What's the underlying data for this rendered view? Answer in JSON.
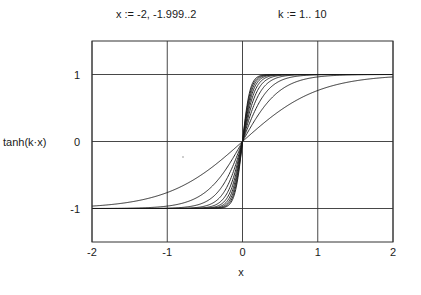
{
  "definitions": {
    "x_range": "x := -2, -1.999..2",
    "k_range": "k := 1.. 10"
  },
  "chart_data": {
    "type": "line",
    "title": "",
    "function": "tanh(k·x)",
    "xlabel": "x",
    "ylabel": "tanh(k·x)",
    "xlim": [
      -2,
      2
    ],
    "ylim": [
      -1.5,
      1.5
    ],
    "x_ticks": [
      -2,
      -1,
      0,
      1,
      2
    ],
    "x_tick_labels": [
      "-2",
      "-1",
      "0",
      "1",
      "2"
    ],
    "y_ticks": [
      -1,
      0,
      1
    ],
    "y_tick_labels": [
      "-1",
      "0",
      "1"
    ],
    "grid": true,
    "legend": false,
    "x_start": -2,
    "x_step": 0.001,
    "x_end": 2,
    "series": [
      {
        "name": "k=1",
        "k": 1
      },
      {
        "name": "k=2",
        "k": 2
      },
      {
        "name": "k=3",
        "k": 3
      },
      {
        "name": "k=4",
        "k": 4
      },
      {
        "name": "k=5",
        "k": 5
      },
      {
        "name": "k=6",
        "k": 6
      },
      {
        "name": "k=7",
        "k": 7
      },
      {
        "name": "k=8",
        "k": 8
      },
      {
        "name": "k=9",
        "k": 9
      },
      {
        "name": "k=10",
        "k": 10
      }
    ],
    "line_color": "#1a1a1a",
    "grid_color": "#333333"
  }
}
